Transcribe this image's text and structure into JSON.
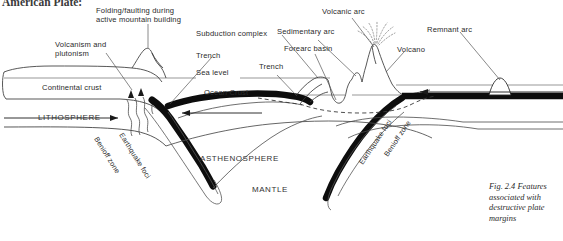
{
  "page": {
    "running_head": "American Plate:",
    "background_color": "#ffffff",
    "ink_color": "#1a1a1a",
    "width": 563,
    "height": 241
  },
  "caption": {
    "text": "Fig. 2.4 Features associated with destructive plate margins",
    "figure_number": "Fig. 2.4"
  },
  "labels": {
    "folding_faulting": "Folding/faulting during\nactive mountain building",
    "volcanism_plutonism": "Volcanism and\nplutonism",
    "trench_left": "Trench",
    "subduction_complex": "Subduction complex",
    "sedimentary_arc": "Sedimentary arc",
    "forearc_basin": "Forearc basin",
    "volcanic_arc": "Volcanic arc",
    "volcano": "Volcano",
    "remnant_arc": "Remnant arc",
    "sea_level": "Sea level",
    "ocean_crust": "Ocean Crust",
    "trench_right": "Trench",
    "continental_crust": "Continental crust",
    "lithosphere": "LITHOSPHERE",
    "asthenosphere": "ASTHENOSPHERE",
    "mantle": "MANTLE",
    "benioff_zone_left": "Benioff zone",
    "earthquake_foci_left": "Earthquake foci",
    "benioff_zone_right": "Benioff zone",
    "earthquake_foci_right": "Earthquake foci"
  }
}
